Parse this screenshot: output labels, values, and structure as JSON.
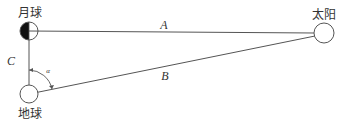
{
  "diagram": {
    "bodies": {
      "moon": {
        "label": "月球",
        "cx": 29,
        "cy": 31,
        "r": 9
      },
      "earth": {
        "label": "地球",
        "cx": 29,
        "cy": 94,
        "r": 9
      },
      "sun": {
        "label": "太阳",
        "cx": 324,
        "cy": 33,
        "r": 10
      }
    },
    "segments": {
      "a": {
        "label": "A"
      },
      "b": {
        "label": "B"
      },
      "c": {
        "label": "C"
      }
    },
    "angle": {
      "label": "α"
    },
    "colors": {
      "line": "#555555",
      "moon_shadow": "#111111",
      "text": "#333333"
    }
  }
}
